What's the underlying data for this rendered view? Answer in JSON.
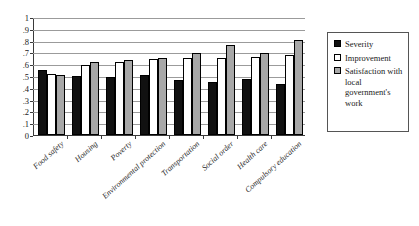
{
  "chart_data": {
    "type": "bar",
    "title": "",
    "xlabel": "",
    "ylabel": "",
    "ylim": [
      0,
      1
    ],
    "ytick_labels": [
      "0",
      ".1",
      ".2",
      ".3",
      ".4",
      ".5",
      ".6",
      ".7",
      ".8",
      ".9",
      "1"
    ],
    "ytick_values": [
      0,
      0.1,
      0.2,
      0.3,
      0.4,
      0.5,
      0.6,
      0.7,
      0.8,
      0.9,
      1
    ],
    "grid": true,
    "legend_position": "right",
    "categories": [
      "Food safety",
      "Housing",
      "Poverty",
      "Environmental protection",
      "Transportation",
      "Social order",
      "Health care",
      "Compulsory education"
    ],
    "series": [
      {
        "name": "Severity",
        "color": "#111111",
        "values": [
          0.55,
          0.5,
          0.495,
          0.51,
          0.465,
          0.45,
          0.475,
          0.435
        ]
      },
      {
        "name": "Improvement",
        "color": "#ffffff",
        "values": [
          0.52,
          0.59,
          0.62,
          0.64,
          0.65,
          0.655,
          0.66,
          0.675
        ]
      },
      {
        "name": "Satisfaction with local government's work",
        "color": "#a8a8a8",
        "values": [
          0.51,
          0.62,
          0.635,
          0.655,
          0.695,
          0.76,
          0.695,
          0.805
        ]
      }
    ]
  },
  "legend": {
    "entries": [
      {
        "label": "Severity",
        "swatch": "severity"
      },
      {
        "label": "Improvement",
        "swatch": "improvement"
      },
      {
        "label": "Satisfaction with local government's work",
        "swatch": "satisfaction"
      }
    ]
  }
}
